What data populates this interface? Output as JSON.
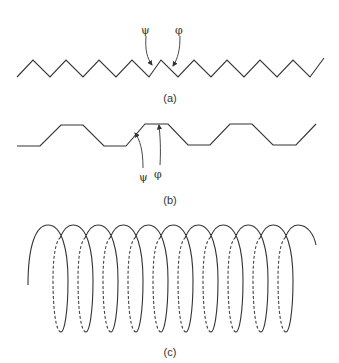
{
  "panels": [
    {
      "id": "a",
      "caption": "(a)",
      "description": "Extended beta-strand zigzag backbone",
      "labels": {
        "psi": "ψ",
        "phi": "φ"
      }
    },
    {
      "id": "b",
      "caption": "(b)",
      "description": "Beta-sheet pleated trapezoid backbone",
      "labels": {
        "psi": "ψ",
        "phi": "φ"
      }
    },
    {
      "id": "c",
      "caption": "(c)",
      "description": "Alpha-helix coil with dashed back segments",
      "turns": 11
    }
  ],
  "colors": {
    "stroke": "#333333",
    "background": "#ffffff"
  }
}
